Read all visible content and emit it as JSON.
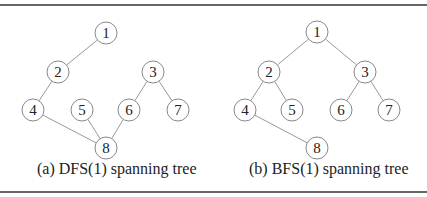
{
  "colors": {
    "edge": "#999999",
    "node_stroke": "#888888",
    "text": "#222222"
  },
  "panels": [
    {
      "caption": "(a) DFS(1) spanning tree",
      "nodes": [
        {
          "id": "1",
          "x": 106,
          "y": 33
        },
        {
          "id": "2",
          "x": 58,
          "y": 72
        },
        {
          "id": "3",
          "x": 153,
          "y": 72
        },
        {
          "id": "4",
          "x": 33,
          "y": 110
        },
        {
          "id": "5",
          "x": 82,
          "y": 110
        },
        {
          "id": "6",
          "x": 129,
          "y": 110
        },
        {
          "id": "7",
          "x": 178,
          "y": 110
        },
        {
          "id": "8",
          "x": 106,
          "y": 148
        }
      ],
      "edges": [
        [
          "1",
          "2"
        ],
        [
          "2",
          "4"
        ],
        [
          "4",
          "8"
        ],
        [
          "5",
          "8"
        ],
        [
          "6",
          "8"
        ],
        [
          "3",
          "6"
        ],
        [
          "3",
          "7"
        ]
      ]
    },
    {
      "caption": "(b) BFS(1) spanning tree",
      "nodes": [
        {
          "id": "1",
          "x": 317,
          "y": 32
        },
        {
          "id": "2",
          "x": 269,
          "y": 72
        },
        {
          "id": "3",
          "x": 365,
          "y": 72
        },
        {
          "id": "4",
          "x": 245,
          "y": 110
        },
        {
          "id": "5",
          "x": 292,
          "y": 110
        },
        {
          "id": "6",
          "x": 341,
          "y": 110
        },
        {
          "id": "7",
          "x": 389,
          "y": 110
        },
        {
          "id": "8",
          "x": 317,
          "y": 148
        }
      ],
      "edges": [
        [
          "1",
          "2"
        ],
        [
          "1",
          "3"
        ],
        [
          "2",
          "4"
        ],
        [
          "2",
          "5"
        ],
        [
          "3",
          "6"
        ],
        [
          "3",
          "7"
        ],
        [
          "4",
          "8"
        ]
      ]
    }
  ]
}
